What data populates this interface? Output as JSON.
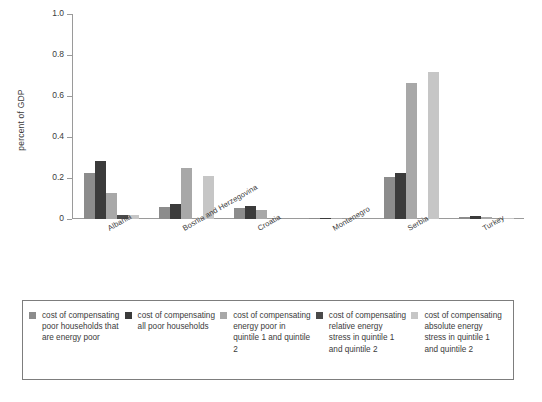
{
  "chart_data": {
    "type": "bar",
    "title": "",
    "xlabel": "",
    "ylabel": "percent of GDP",
    "ylim": [
      0,
      1.0
    ],
    "yticks": [
      "0",
      "0.2",
      "0.4",
      "0.6",
      "0.8",
      "1.0"
    ],
    "ytick_values": [
      0,
      0.2,
      0.4,
      0.6,
      0.8,
      1.0
    ],
    "grid": false,
    "legend_position": "bottom",
    "categories": [
      "Albania",
      "Bosnia and Herzegovina",
      "Croatia",
      "Montenegro",
      "Serbia",
      "Turkey"
    ],
    "series": [
      {
        "name": "cost of compensating poor households that are energy poor",
        "color": "#8c8c8c",
        "values": [
          0.225,
          0.06,
          0.055,
          0.006,
          0.205,
          0.012
        ]
      },
      {
        "name": "cost of compensating all poor households",
        "color": "#3b3b3b",
        "values": [
          0.285,
          0.075,
          0.062,
          0.007,
          0.225,
          0.015
        ]
      },
      {
        "name": "cost of compensating energy poor in quintile 1 and quintile 2",
        "color": "#a8a8a8",
        "values": [
          0.125,
          0.25,
          0.046,
          0.004,
          0.665,
          0.009
        ]
      },
      {
        "name": "cost of compensating relative energy stress in quintile 1 and quintile 2",
        "color": "#4a4a4a",
        "values": [
          0.022,
          0.0,
          0.0,
          0.0,
          0.0,
          0.0
        ]
      },
      {
        "name": "cost of compensating absolute energy stress in quintile 1 and quintile 2",
        "color": "#c6c6c6",
        "values": [
          0.02,
          0.21,
          0.0,
          0.0,
          0.715,
          0.007
        ]
      }
    ]
  },
  "legend": {
    "items": [
      {
        "label": "cost of compensating poor households that are energy poor",
        "color": "#8c8c8c"
      },
      {
        "label": "cost of compensating all poor households",
        "color": "#3b3b3b"
      },
      {
        "label": "cost of compensating energy poor in quintile 1 and quintile 2",
        "color": "#a8a8a8"
      },
      {
        "label": "cost of compensating relative energy stress in quintile 1 and quintile 2",
        "color": "#4a4a4a"
      },
      {
        "label": "cost of compensating absolute energy stress in quintile 1 and quintile 2",
        "color": "#c6c6c6"
      }
    ]
  }
}
